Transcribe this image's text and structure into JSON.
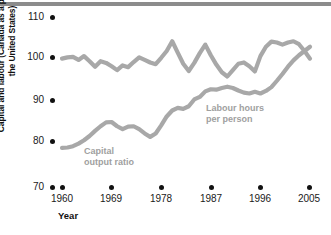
{
  "chart_data": {
    "type": "line",
    "title": "",
    "xlabel": "Year",
    "ylabel": "Capital and labour (Canada as a percentage of the United States)",
    "xlim": [
      1960,
      2005
    ],
    "ylim": [
      70,
      110
    ],
    "yticks": [
      70,
      80,
      90,
      100,
      110
    ],
    "xticks": [
      1960,
      1969,
      1978,
      1987,
      1996,
      2005
    ],
    "grid": false,
    "legend_position": "inline-annotations",
    "series": [
      {
        "name": "Capital output ratio",
        "color": "#a8a8a8",
        "x": [
          1960,
          1961,
          1962,
          1963,
          1964,
          1965,
          1966,
          1967,
          1968,
          1969,
          1970,
          1971,
          1972,
          1973,
          1974,
          1975,
          1976,
          1977,
          1978,
          1979,
          1980,
          1981,
          1982,
          1983,
          1984,
          1985,
          1986,
          1987,
          1988,
          1989,
          1990,
          1991,
          1992,
          1993,
          1994,
          1995,
          1996,
          1997,
          1998,
          1999,
          2000,
          2001,
          2002,
          2003,
          2004,
          2005
        ],
        "values": [
          79.2,
          79.3,
          79.6,
          80.2,
          81.0,
          82.0,
          83.2,
          84.3,
          85.2,
          85.3,
          84.3,
          83.6,
          84.2,
          84.3,
          83.6,
          82.6,
          81.8,
          82.6,
          84.5,
          86.6,
          88.0,
          88.6,
          88.4,
          89.0,
          90.6,
          91.2,
          92.5,
          93.0,
          92.9,
          93.3,
          93.6,
          93.3,
          92.7,
          92.2,
          92.0,
          92.4,
          92.0,
          92.6,
          93.5,
          95.0,
          96.6,
          98.3,
          99.8,
          101.0,
          102.0,
          103.0
        ]
      },
      {
        "name": "Labour hours per person",
        "color": "#a8a8a8",
        "x": [
          1960,
          1961,
          1962,
          1963,
          1964,
          1965,
          1966,
          1967,
          1968,
          1969,
          1970,
          1971,
          1972,
          1973,
          1974,
          1975,
          1976,
          1977,
          1978,
          1979,
          1980,
          1981,
          1982,
          1983,
          1984,
          1985,
          1986,
          1987,
          1988,
          1989,
          1990,
          1991,
          1992,
          1993,
          1994,
          1995,
          1996,
          1997,
          1998,
          1999,
          2000,
          2001,
          2002,
          2003,
          2004,
          2005
        ],
        "values": [
          100.2,
          100.5,
          100.6,
          99.9,
          100.8,
          99.6,
          98.3,
          99.6,
          99.2,
          98.4,
          97.5,
          98.6,
          98.2,
          99.4,
          100.5,
          99.9,
          99.3,
          98.9,
          100.4,
          102.0,
          104.3,
          101.6,
          99.0,
          97.3,
          99.2,
          101.5,
          103.5,
          101.0,
          98.8,
          97.0,
          96.0,
          97.5,
          99.0,
          99.3,
          98.4,
          97.2,
          100.8,
          103.0,
          104.2,
          104.0,
          103.5,
          104.0,
          104.3,
          103.6,
          102.0,
          100.2
        ]
      }
    ],
    "annotations": [
      {
        "text_line1": "Capital",
        "text_line2": "output ratio"
      },
      {
        "text_line1": "Labour hours",
        "text_line2": "per person"
      }
    ]
  },
  "axis": {
    "y_title": "Capital and labour (Canada as a percentage of the United States)",
    "x_title": "Year",
    "y_tick_labels": [
      "110",
      "100",
      "90",
      "80",
      "70"
    ],
    "x_tick_labels": [
      "1960",
      "1969",
      "1978",
      "1987",
      "1996",
      "2005"
    ]
  },
  "labels": {
    "capital_line1": "Capital",
    "capital_line2": "output ratio",
    "labour_line1": "Labour hours",
    "labour_line2": "per person"
  },
  "colors": {
    "series": "#a8a8a8",
    "text": "#111111",
    "annotation": "#a0a0a0",
    "topbar": "#8c8c8c"
  }
}
